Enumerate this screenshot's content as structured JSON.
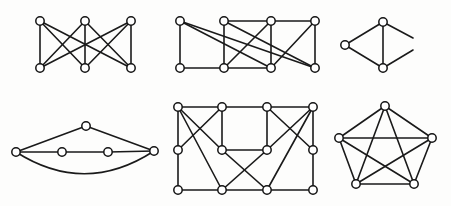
{
  "figure": {
    "background_color": "#fdfdfc",
    "edge_color": "#1a1a1a",
    "vertex_fill_color": "#ffffff",
    "vertex_stroke_color": "#141414",
    "vertex_radius": 4.2,
    "edge_width": 1.6,
    "canvas": {
      "width": 451,
      "height": 206
    },
    "graph_count": 6
  },
  "chart_data": {
    "type": "diagram",
    "xlabel": "",
    "ylabel": "",
    "graphs": [
      {
        "name": "graph-1-complete-bipartite-k33",
        "label": "K(3,3) complete bipartite graph",
        "position": "top-left",
        "vertex_count": 6,
        "edge_count": 9,
        "vertices": [
          {
            "id": "t1",
            "x": 40,
            "y": 21
          },
          {
            "id": "t2",
            "x": 85,
            "y": 21
          },
          {
            "id": "t3",
            "x": 131,
            "y": 21
          },
          {
            "id": "b1",
            "x": 40,
            "y": 68
          },
          {
            "id": "b2",
            "x": 85,
            "y": 68
          },
          {
            "id": "b3",
            "x": 131,
            "y": 68
          }
        ],
        "edges": [
          [
            "t1",
            "b1"
          ],
          [
            "t1",
            "b2"
          ],
          [
            "t1",
            "b3"
          ],
          [
            "t2",
            "b1"
          ],
          [
            "t2",
            "b2"
          ],
          [
            "t2",
            "b3"
          ],
          [
            "t3",
            "b1"
          ],
          [
            "t3",
            "b2"
          ],
          [
            "t3",
            "b3"
          ]
        ]
      },
      {
        "name": "graph-2-eight-vertex-bipartite-style",
        "label": "Eight vertex graph, two rows of four",
        "position": "top-middle",
        "vertex_count": 8,
        "edge_count": 13,
        "vertices": [
          {
            "id": "t1",
            "x": 180,
            "y": 21
          },
          {
            "id": "t2",
            "x": 224,
            "y": 21
          },
          {
            "id": "t3",
            "x": 271,
            "y": 21
          },
          {
            "id": "t4",
            "x": 315,
            "y": 21
          },
          {
            "id": "b1",
            "x": 180,
            "y": 68
          },
          {
            "id": "b2",
            "x": 224,
            "y": 68
          },
          {
            "id": "b3",
            "x": 271,
            "y": 68
          },
          {
            "id": "b4",
            "x": 315,
            "y": 68
          }
        ],
        "edges": [
          [
            "t1",
            "b1"
          ],
          [
            "t1",
            "b3"
          ],
          [
            "t1",
            "b4"
          ],
          [
            "t2",
            "t3"
          ],
          [
            "t3",
            "t4"
          ],
          [
            "t2",
            "b2"
          ],
          [
            "t3",
            "b2"
          ],
          [
            "t3",
            "b3"
          ],
          [
            "t4",
            "b3"
          ],
          [
            "b1",
            "b2"
          ],
          [
            "b2",
            "b3"
          ],
          [
            "t2",
            "b4"
          ],
          [
            "t4",
            "b4"
          ]
        ]
      },
      {
        "name": "graph-3-triangle-with-cropped-edges",
        "label": "Small graph with two edges cropped at image border",
        "position": "top-right",
        "vertex_count": 3,
        "edge_count": 6,
        "vertices": [
          {
            "id": "l",
            "x": 345,
            "y": 45
          },
          {
            "id": "tp",
            "x": 383,
            "y": 22
          },
          {
            "id": "bt",
            "x": 383,
            "y": 68
          }
        ],
        "edges": [
          [
            "l",
            "tp"
          ],
          [
            "l",
            "bt"
          ],
          [
            "tp",
            "bt"
          ]
        ],
        "cropped_edges": [
          {
            "from": "tp",
            "to_x": 413,
            "to_y": 38
          },
          {
            "from": "bt",
            "to_x": 413,
            "to_y": 50
          }
        ]
      },
      {
        "name": "graph-4-path-with-apex-and-arc",
        "label": "Five vertex graph: horizontal path, apex triangle and curved arc",
        "position": "bottom-left",
        "vertex_count": 5,
        "edge_count": 6,
        "vertices": [
          {
            "id": "l",
            "x": 16,
            "y": 152
          },
          {
            "id": "m1",
            "x": 62,
            "y": 152
          },
          {
            "id": "m2",
            "x": 108,
            "y": 152
          },
          {
            "id": "r",
            "x": 154,
            "y": 151
          },
          {
            "id": "ap",
            "x": 86,
            "y": 126
          }
        ],
        "edges": [
          [
            "l",
            "m1"
          ],
          [
            "m1",
            "m2"
          ],
          [
            "m2",
            "r"
          ],
          [
            "l",
            "ap"
          ],
          [
            "ap",
            "r"
          ]
        ],
        "curved_edges": [
          {
            "from": "l",
            "to": "r",
            "control_x": 85,
            "control_y": 196
          }
        ]
      },
      {
        "name": "graph-5-ten-vertex-symmetric",
        "label": "Ten vertex graph with symmetric crossing edges",
        "position": "bottom-middle",
        "vertex_count": 10,
        "edge_count": 18,
        "vertices": [
          {
            "id": "tl",
            "x": 178,
            "y": 107
          },
          {
            "id": "t2",
            "x": 222,
            "y": 107
          },
          {
            "id": "t3",
            "x": 267,
            "y": 107
          },
          {
            "id": "tr",
            "x": 313,
            "y": 107
          },
          {
            "id": "ml",
            "x": 178,
            "y": 150
          },
          {
            "id": "c1",
            "x": 222,
            "y": 150
          },
          {
            "id": "c2",
            "x": 267,
            "y": 150
          },
          {
            "id": "mr",
            "x": 313,
            "y": 150
          },
          {
            "id": "bl",
            "x": 178,
            "y": 190
          },
          {
            "id": "b2",
            "x": 222,
            "y": 190
          },
          {
            "id": "b3",
            "x": 267,
            "y": 190
          },
          {
            "id": "br",
            "x": 313,
            "y": 190
          }
        ],
        "edges": [
          [
            "tl",
            "t2"
          ],
          [
            "t2",
            "t3"
          ],
          [
            "t3",
            "tr"
          ],
          [
            "tl",
            "ml"
          ],
          [
            "ml",
            "bl"
          ],
          [
            "bl",
            "b2"
          ],
          [
            "b2",
            "b3"
          ],
          [
            "b3",
            "br"
          ],
          [
            "tr",
            "mr"
          ],
          [
            "mr",
            "br"
          ],
          [
            "t2",
            "c1"
          ],
          [
            "t3",
            "c2"
          ],
          [
            "c1",
            "c2"
          ],
          [
            "tl",
            "c1"
          ],
          [
            "t2",
            "ml"
          ],
          [
            "tl",
            "b2"
          ],
          [
            "tr",
            "c2"
          ],
          [
            "t3",
            "mr"
          ],
          [
            "tr",
            "b3"
          ],
          [
            "c1",
            "b3"
          ],
          [
            "c2",
            "b2"
          ]
        ]
      },
      {
        "name": "graph-6-complete-graph-k5",
        "label": "K5 complete graph on five vertices",
        "position": "bottom-right",
        "vertex_count": 5,
        "edge_count": 10,
        "vertices": [
          {
            "id": "v1",
            "x": 385,
            "y": 106
          },
          {
            "id": "v2",
            "x": 432,
            "y": 138
          },
          {
            "id": "v3",
            "x": 414,
            "y": 184
          },
          {
            "id": "v4",
            "x": 356,
            "y": 184
          },
          {
            "id": "v5",
            "x": 339,
            "y": 138
          }
        ],
        "edges": [
          [
            "v1",
            "v2"
          ],
          [
            "v1",
            "v3"
          ],
          [
            "v1",
            "v4"
          ],
          [
            "v1",
            "v5"
          ],
          [
            "v2",
            "v3"
          ],
          [
            "v2",
            "v4"
          ],
          [
            "v2",
            "v5"
          ],
          [
            "v3",
            "v4"
          ],
          [
            "v3",
            "v5"
          ],
          [
            "v4",
            "v5"
          ]
        ]
      }
    ]
  }
}
